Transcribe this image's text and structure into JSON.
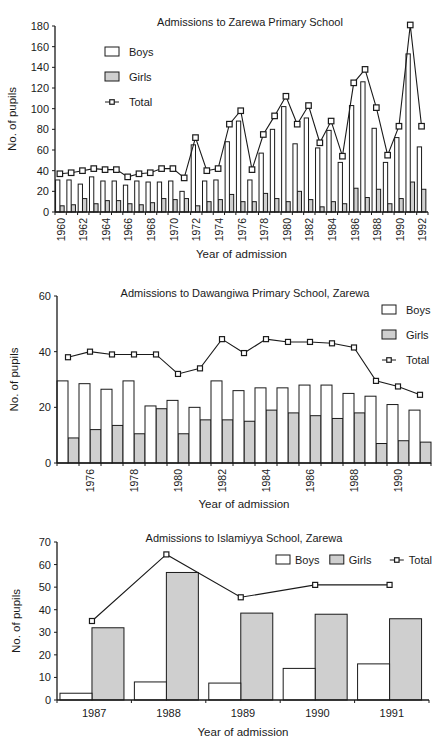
{
  "chart_data": [
    {
      "type": "bar",
      "title": "Admissions to Zarewa Primary School",
      "xlabel": "Year of admission",
      "ylabel": "No. of pupils",
      "ylim": [
        0,
        180
      ],
      "yticks": [
        0,
        20,
        40,
        60,
        80,
        100,
        120,
        140,
        160,
        180
      ],
      "xtick_labels": [
        "1960",
        "1962",
        "1964",
        "1966",
        "1968",
        "1970",
        "1972",
        "1974",
        "1976",
        "1978",
        "1980",
        "1982",
        "1984",
        "1986",
        "1988",
        "1990",
        "1992"
      ],
      "legend": [
        "Boys",
        "Girls",
        "Total"
      ],
      "legend_position": "upper left",
      "grid": false,
      "categories": [
        "1960",
        "1961",
        "1962",
        "1963",
        "1964",
        "1965",
        "1966",
        "1967",
        "1968",
        "1969",
        "1970",
        "1971",
        "1972",
        "1973",
        "1974",
        "1975",
        "1976",
        "1977",
        "1978",
        "1979",
        "1980",
        "1981",
        "1982",
        "1983",
        "1984",
        "1985",
        "1986",
        "1987",
        "1988",
        "1989",
        "1990",
        "1991",
        "1992"
      ],
      "series": [
        {
          "name": "Boys",
          "kind": "bar",
          "values": [
            31,
            31,
            27,
            34,
            30,
            30,
            26,
            30,
            29,
            29,
            30,
            20,
            65,
            30,
            31,
            68,
            88,
            31,
            57,
            80,
            102,
            66,
            91,
            62,
            79,
            48,
            103,
            126,
            81,
            48,
            72,
            153,
            63
          ]
        },
        {
          "name": "Girls",
          "kind": "bar",
          "values": [
            6,
            7,
            13,
            8,
            11,
            11,
            8,
            7,
            9,
            13,
            12,
            13,
            6,
            10,
            12,
            17,
            10,
            10,
            18,
            13,
            10,
            20,
            12,
            5,
            10,
            8,
            23,
            14,
            22,
            8,
            13,
            29,
            22
          ]
        },
        {
          "name": "Total",
          "kind": "line",
          "values": [
            37,
            38,
            40,
            42,
            41,
            41,
            34,
            37,
            38,
            42,
            42,
            33,
            72,
            40,
            42,
            85,
            98,
            41,
            75,
            93,
            112,
            85,
            103,
            67,
            88,
            54,
            125,
            138,
            101,
            55,
            83,
            181,
            83
          ]
        }
      ]
    },
    {
      "type": "bar",
      "title": "Admissions to Dawangiwa Primary School, Zarewa",
      "xlabel": "Year of admission",
      "ylabel": "No. of pupils",
      "ylim": [
        0,
        60
      ],
      "yticks": [
        0,
        20,
        40,
        60
      ],
      "xtick_labels": [
        "1976",
        "1978",
        "1980",
        "1982",
        "1984",
        "1986",
        "1988",
        "1990"
      ],
      "legend": [
        "Boys",
        "Girls",
        "Total"
      ],
      "legend_position": "upper right",
      "grid": false,
      "categories": [
        "1975",
        "1976",
        "1977",
        "1978",
        "1979",
        "1980",
        "1981",
        "1982",
        "1983",
        "1984",
        "1985",
        "1986",
        "1987",
        "1988",
        "1989",
        "1990",
        "1991"
      ],
      "series": [
        {
          "name": "Boys",
          "kind": "bar",
          "values": [
            29.5,
            28.5,
            26.5,
            29.5,
            20.5,
            22.5,
            20,
            29.5,
            26,
            27,
            27,
            28,
            28,
            25,
            24,
            21,
            19
          ]
        },
        {
          "name": "Girls",
          "kind": "bar",
          "values": [
            9,
            12,
            13.5,
            10.5,
            19.5,
            10.5,
            15.5,
            15.5,
            15,
            19,
            18,
            17,
            16,
            18,
            7,
            8,
            7.5
          ]
        },
        {
          "name": "Total",
          "kind": "line",
          "values": [
            38,
            40,
            39,
            39,
            39,
            32,
            34,
            44.5,
            39.5,
            44.5,
            43.5,
            43.5,
            43,
            41.5,
            29.5,
            27.5,
            24.5
          ]
        }
      ]
    },
    {
      "type": "bar",
      "title": "Admissions to Islamiyya School, Zarewa",
      "xlabel": "Year of admission",
      "ylabel": "No. of pupils",
      "ylim": [
        0,
        70
      ],
      "yticks": [
        0,
        10,
        20,
        30,
        40,
        50,
        60,
        70
      ],
      "xtick_labels": [
        "1987",
        "1988",
        "1989",
        "1990",
        "1991"
      ],
      "legend": [
        "Boys",
        "Girls",
        "Total"
      ],
      "legend_position": "upper right (horizontal)",
      "grid": false,
      "categories": [
        "1987",
        "1988",
        "1989",
        "1990",
        "1991"
      ],
      "series": [
        {
          "name": "Boys",
          "kind": "bar",
          "values": [
            3,
            8,
            7.5,
            14,
            16
          ]
        },
        {
          "name": "Girls",
          "kind": "bar",
          "values": [
            32,
            56.5,
            38.5,
            38,
            36
          ]
        },
        {
          "name": "Total",
          "kind": "line",
          "values": [
            35,
            64.5,
            45.5,
            51,
            51
          ]
        }
      ]
    }
  ],
  "colors": {
    "boys_fill": "#ffffff",
    "girls_fill": "#cfcfcf",
    "outline": "#1a1a1a",
    "marker_fill": "#ffffff"
  }
}
